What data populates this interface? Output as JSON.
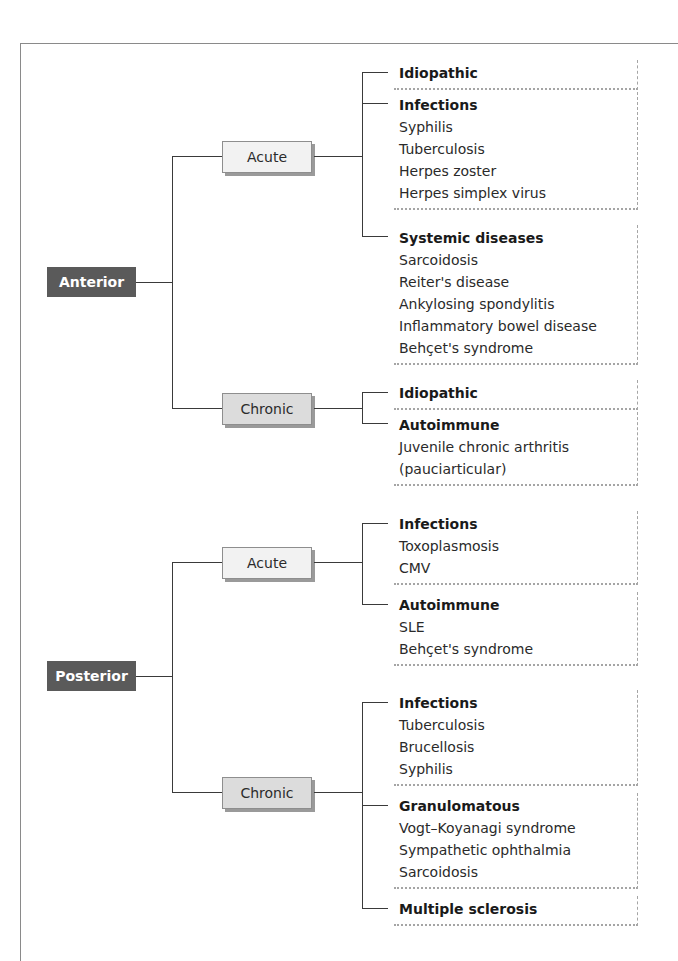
{
  "colors": {
    "root_fill": "#5a5a5a",
    "acute_fill": "#f2f2f2",
    "chronic_fill": "#dcdcdc",
    "line": "#3a3a3a"
  },
  "anterior": {
    "label": "Anterior",
    "acute": {
      "label": "Acute",
      "groups": [
        {
          "title": "Idiopathic",
          "items": []
        },
        {
          "title": "Infections",
          "items": [
            "Syphilis",
            "Tuberculosis",
            "Herpes zoster",
            "Herpes simplex virus"
          ]
        },
        {
          "title": "Systemic diseases",
          "items": [
            "Sarcoidosis",
            "Reiter's disease",
            "Ankylosing spondylitis",
            "Inflammatory bowel disease",
            "Behçet's syndrome"
          ]
        }
      ]
    },
    "chronic": {
      "label": "Chronic",
      "groups": [
        {
          "title": "Idiopathic",
          "items": []
        },
        {
          "title": "Autoimmune",
          "items": [
            "Juvenile chronic arthritis",
            "(pauciarticular)"
          ]
        }
      ]
    }
  },
  "posterior": {
    "label": "Posterior",
    "acute": {
      "label": "Acute",
      "groups": [
        {
          "title": "Infections",
          "items": [
            "Toxoplasmosis",
            "CMV"
          ]
        },
        {
          "title": "Autoimmune",
          "items": [
            "SLE",
            "Behçet's syndrome"
          ]
        }
      ]
    },
    "chronic": {
      "label": "Chronic",
      "groups": [
        {
          "title": "Infections",
          "items": [
            "Tuberculosis",
            "Brucellosis",
            "Syphilis"
          ]
        },
        {
          "title": "Granulomatous",
          "items": [
            "Vogt–Koyanagi syndrome",
            "Sympathetic ophthalmia",
            "Sarcoidosis"
          ]
        },
        {
          "title": "Multiple sclerosis",
          "items": []
        }
      ]
    }
  }
}
